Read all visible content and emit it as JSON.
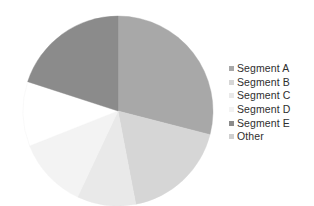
{
  "chart_data": {
    "type": "pie",
    "title": "",
    "subtitle": "",
    "xlabel": "",
    "ylabel": "",
    "grid": false,
    "legend_position": "right",
    "start_angle_deg": 0,
    "direction": "clockwise",
    "center": {
      "x": 118,
      "y": 111
    },
    "radius": 95,
    "categories": [
      "Segment A",
      "Segment B",
      "Segment C",
      "Segment D",
      "Segment E",
      "Other"
    ],
    "values": [
      29,
      18,
      10,
      12,
      20,
      11
    ],
    "unit": "%",
    "colors": [
      "#a8a8a8",
      "#d6d6d6",
      "#e9e9e9",
      "#f3f3f3",
      "#8b8b8b",
      "#ffffff"
    ],
    "slices": [
      {
        "label": "Segment A",
        "value": 29,
        "color": "#a8a8a8",
        "start_deg": 0,
        "end_deg": 104.4
      },
      {
        "label": "Segment B",
        "value": 18,
        "color": "#d6d6d6",
        "start_deg": 104.4,
        "end_deg": 169.2
      },
      {
        "label": "Segment C",
        "value": 10,
        "color": "#e9e9e9",
        "start_deg": 169.2,
        "end_deg": 205.2
      },
      {
        "label": "Segment D",
        "value": 12,
        "color": "#f3f3f3",
        "start_deg": 205.2,
        "end_deg": 248.4
      },
      {
        "label": "Other",
        "value": 11,
        "color": "#ffffff",
        "start_deg": 248.4,
        "end_deg": 288.0
      },
      {
        "label": "Segment E",
        "value": 20,
        "color": "#8b8b8b",
        "start_deg": 288.0,
        "end_deg": 360.0
      }
    ]
  },
  "legend": {
    "items": [
      {
        "label": "Segment A",
        "color": "#a8a8a8"
      },
      {
        "label": "Segment B",
        "color": "#d6d6d6"
      },
      {
        "label": "Segment C",
        "color": "#e9e9e9"
      },
      {
        "label": "Segment D",
        "color": "#f3f3f3"
      },
      {
        "label": "Segment E",
        "color": "#8b8b8b"
      },
      {
        "label": "Other",
        "color": "#cfcfcf"
      }
    ]
  }
}
